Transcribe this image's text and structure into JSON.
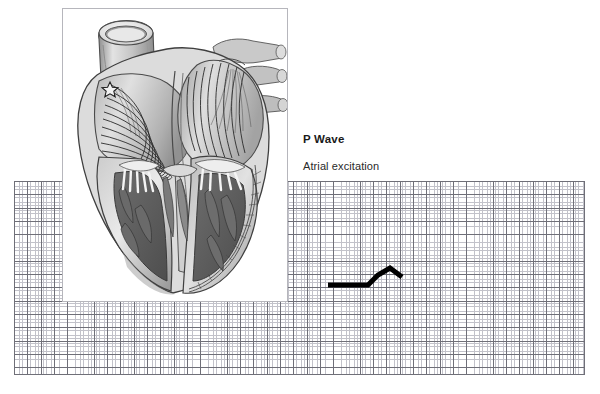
{
  "figure": {
    "title": "P Wave",
    "subtitle": "Atrial excitation",
    "phase_name": "P Wave"
  },
  "heart_illustration": {
    "alt_name": "anatomical-heart-cutaway",
    "description": "Grayscale cutaway illustration of the human heart showing atrial excitation spreading from the sinoatrial node",
    "highlighted_region": "atria",
    "node_marker": "sinoatrial-node-star",
    "wavefront_line_count": 11,
    "colors": {
      "outline": "#3a3a3a",
      "light_tissue": "#d8d8d8",
      "mid_tissue": "#a9a9a9",
      "dark_tissue": "#6b6b6b",
      "muscle_dark": "#5a5a5a",
      "frame_border": "#b6b6bc"
    }
  },
  "ecg_grid": {
    "major_line_color": "#6f6f78",
    "minor_line_color": "#c2c2ca",
    "background_color": "#ffffff",
    "major_spacing_px": 13.3,
    "minor_spacing_px": 2.66,
    "minor_per_major": 5
  },
  "chart_data": {
    "type": "line",
    "title": "P Wave",
    "subtitle": "Atrial excitation",
    "xlabel": "",
    "ylabel": "",
    "grid": true,
    "legend": "none",
    "trace_color": "#000000",
    "trace_width_px": 5,
    "baseline_y": 104,
    "x": [
      314,
      354,
      364,
      376,
      388
    ],
    "y": [
      104,
      104,
      94,
      87,
      96
    ],
    "points": [
      {
        "x": 314,
        "y": 104,
        "label": "baseline-start"
      },
      {
        "x": 354,
        "y": 104,
        "label": "p-wave-onset"
      },
      {
        "x": 364,
        "y": 94,
        "label": "p-wave-upstroke"
      },
      {
        "x": 376,
        "y": 87,
        "label": "p-wave-peak"
      },
      {
        "x": 388,
        "y": 96,
        "label": "p-wave-offset"
      }
    ]
  }
}
